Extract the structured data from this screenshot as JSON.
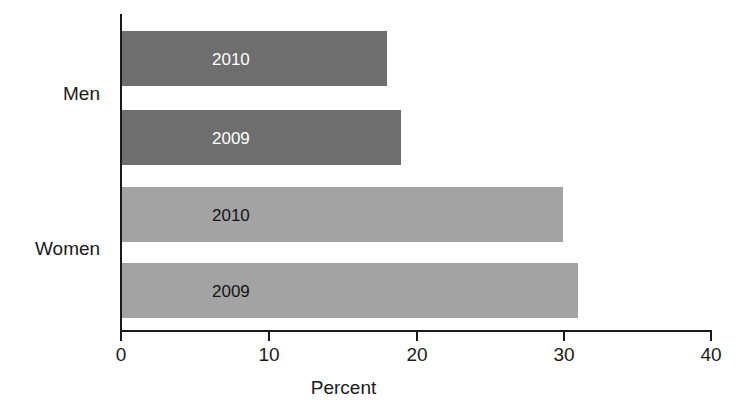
{
  "chart_data": {
    "type": "bar",
    "orientation": "horizontal",
    "title": "",
    "xlabel": "Percent",
    "ylabel": "",
    "xlim": [
      0,
      40
    ],
    "xticks": [
      0,
      10,
      20,
      30,
      40
    ],
    "xtick_labels": [
      "0",
      "10",
      "20",
      "30",
      "40"
    ],
    "grid": false,
    "legend": false,
    "groups": [
      "Men",
      "Women"
    ],
    "categories": [
      "Men 2010",
      "Men 2009",
      "Women 2010",
      "Women 2009"
    ],
    "values": [
      18,
      19,
      30,
      31
    ],
    "series": [
      {
        "name": "Men",
        "color": "#6e6e6e",
        "label_color": "#ffffff",
        "bars": [
          {
            "label": "2010",
            "value": 18
          },
          {
            "label": "2009",
            "value": 19
          }
        ]
      },
      {
        "name": "Women",
        "color": "#a3a3a3",
        "label_color": "#141414",
        "bars": [
          {
            "label": "2010",
            "value": 30
          },
          {
            "label": "2009",
            "value": 31
          }
        ]
      }
    ]
  },
  "axis": {
    "x_title": "Percent",
    "ticks": [
      {
        "value": "0"
      },
      {
        "value": "10"
      },
      {
        "value": "20"
      },
      {
        "value": "30"
      },
      {
        "value": "40"
      }
    ]
  },
  "groups": [
    {
      "name": "Men"
    },
    {
      "name": "Women"
    }
  ],
  "bars": [
    {
      "label": "2010",
      "group": "Men",
      "value": 18
    },
    {
      "label": "2009",
      "group": "Men",
      "value": 19
    },
    {
      "label": "2010",
      "group": "Women",
      "value": 30
    },
    {
      "label": "2009",
      "group": "Women",
      "value": 31
    }
  ],
  "colors": {
    "men_bar": "#6e6e6e",
    "women_bar": "#a3a3a3",
    "axis": "#1a1a1a",
    "background": "#ffffff",
    "dark_bar_label": "#ffffff",
    "light_bar_label": "#141414"
  }
}
